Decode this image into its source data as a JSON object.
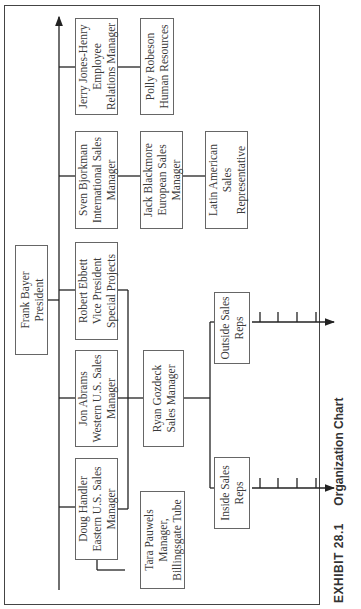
{
  "caption": {
    "exhibit": "EXHIBIT 28.1",
    "title": "Organization Chart"
  },
  "president": {
    "name": "Frank Bayer",
    "title": "President"
  },
  "direct_reports": [
    {
      "name": "Doug Handler",
      "title_1": "Eastern U.S. Sales",
      "title_2": "Manager"
    },
    {
      "name": "Jon Abrams",
      "title_1": "Western U.S. Sales",
      "title_2": "Manager"
    },
    {
      "name": "Robert Ebbett",
      "title_1": "Vice President",
      "title_2": "Special Projects"
    },
    {
      "name": "Sven Bjorkman",
      "title_1": "International Sales",
      "title_2": "Manager"
    },
    {
      "name": "Jerry Jones-Henry",
      "title_1": "Employee",
      "title_2": "Relations Manager"
    }
  ],
  "second_level": {
    "tara": {
      "name": "Tara Pauwels",
      "title_1": "Manager,",
      "title_2": "Billingsgate Tube"
    },
    "ryan": {
      "name": "Ryan Gozdeck",
      "title": "Sales Manager"
    },
    "jack": {
      "name": "Jack Blackmore",
      "title_1": "European Sales",
      "title_2": "Manager"
    },
    "polly": {
      "name": "Polly Robeson",
      "title": "Human Resources"
    }
  },
  "third_level": {
    "inside_reps": {
      "line_1": "Inside Sales",
      "line_2": "Reps"
    },
    "outside_reps": {
      "line_1": "Outside Sales",
      "line_2": "Reps"
    },
    "latin_american": {
      "line_1": "Latin American",
      "line_2": "Sales",
      "line_3": "Representative"
    }
  },
  "rep_ticks": {
    "inside_count": 5,
    "outside_count": 5
  },
  "colors": {
    "line": "#222222",
    "box_border": "#666666",
    "text": "#3a3a3a"
  }
}
